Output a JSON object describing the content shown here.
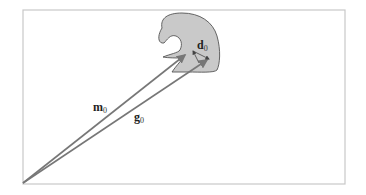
{
  "diagram": {
    "frame": {
      "x": 23,
      "y": 10,
      "width": 322,
      "height": 174,
      "stroke": "#c8c8c8"
    },
    "origin": {
      "x": 23,
      "y": 183
    },
    "shape": {
      "fill": "#c9c9c9",
      "stroke": "#555555",
      "description": "grey blob object with a notch"
    },
    "vectors": [
      {
        "id": "m0",
        "label": "m",
        "subscript": "0",
        "from": [
          23,
          183
        ],
        "to": [
          185,
          55
        ],
        "color": "#777777"
      },
      {
        "id": "g0",
        "label": "g",
        "subscript": "0",
        "from": [
          23,
          183
        ],
        "to": [
          207,
          60
        ],
        "color": "#777777"
      },
      {
        "id": "d0",
        "label": "d",
        "subscript": "0",
        "from": [
          193,
          51
        ],
        "to": [
          209,
          59
        ],
        "color": "#555555"
      }
    ],
    "labels": {
      "m0": {
        "main": "m",
        "sub": "0"
      },
      "g0": {
        "main": "g",
        "sub": "0"
      },
      "d0": {
        "main": "d",
        "sub": "0"
      }
    }
  }
}
